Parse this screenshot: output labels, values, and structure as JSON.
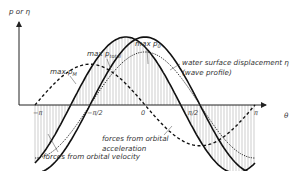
{
  "diagram": {
    "y_axis_label": "p or η",
    "x_axis_label": "θ",
    "ticks": [
      "−π",
      "−π/2",
      "0",
      "π/2",
      "π"
    ],
    "labels": {
      "max_pM": {
        "main": "max p",
        "sub": "M"
      },
      "max_ptotal": {
        "main": "max p",
        "sub": "total"
      },
      "max_p0": {
        "main": "max p",
        "sub": "0"
      },
      "water_surface_1": "water surface displacement η",
      "water_surface_2": "(wave profile)",
      "orbital_acc_1": "forces from orbital",
      "orbital_acc_2": "acceleration",
      "orbital_vel": "forces from orbital velocity"
    },
    "curves": [
      {
        "name": "water-surface-displacement",
        "style": "dotted",
        "amplitude": 0.78,
        "phase": 0
      },
      {
        "name": "orbital-velocity-force",
        "style": "solid",
        "amplitude": 1.0,
        "phase": 0
      },
      {
        "name": "orbital-acceleration-force",
        "style": "dashed",
        "amplitude": 0.6,
        "phase": -1.5708
      },
      {
        "name": "total-force",
        "style": "solid",
        "amplitude": 1.0,
        "phase": -0.55
      }
    ]
  }
}
